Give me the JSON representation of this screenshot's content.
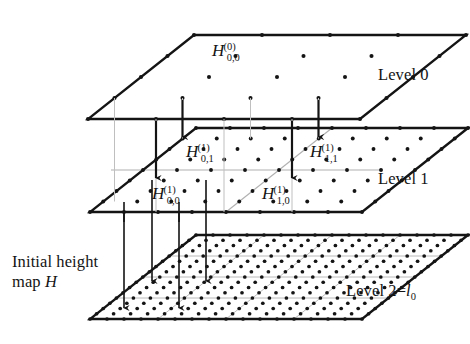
{
  "figure": {
    "type": "diagram"
  },
  "labels": {
    "level0": "Level 0",
    "level1": "Level 1",
    "level2": "Level 2=",
    "level2_symbol": "l",
    "level2_subscript": "0",
    "initial_line1": "Initial height",
    "initial_line2_prefix": "map ",
    "initial_line2_symbol": "H"
  },
  "nodes": [
    {
      "id": "h00_L0",
      "base": "H",
      "sup": "(0)",
      "sub": "0,0",
      "level": 0,
      "x": 224,
      "y": 48
    },
    {
      "id": "h01_L1",
      "base": "H",
      "sup": "(1)",
      "sub": "0,1",
      "level": 1,
      "x": 191,
      "y": 139
    },
    {
      "id": "h11_L1",
      "base": "H",
      "sup": "(1)",
      "sub": "1,1",
      "level": 1,
      "x": 300,
      "y": 139
    },
    {
      "id": "h00_L1",
      "base": "H",
      "sup": "(1)",
      "sub": "0,0",
      "level": 1,
      "x": 147,
      "y": 180
    },
    {
      "id": "h10_L1",
      "base": "H",
      "sup": "(1)",
      "sub": "1,0",
      "level": 1,
      "x": 252,
      "y": 180
    }
  ],
  "planes": [
    {
      "name": "level-0-plane",
      "grid": 4,
      "dot_density": "coarse",
      "label": "Level 0"
    },
    {
      "name": "level-1-plane",
      "grid": 8,
      "dot_density": "medium",
      "label": "Level 1"
    },
    {
      "name": "level-2-plane",
      "grid": 16,
      "dot_density": "fine",
      "label": "Level 2=l0"
    }
  ],
  "colors": {
    "ink": "#141414",
    "grid_gray": "#9a9a9a",
    "thin_gray": "#b5b5b5",
    "background": "#ffffff"
  }
}
